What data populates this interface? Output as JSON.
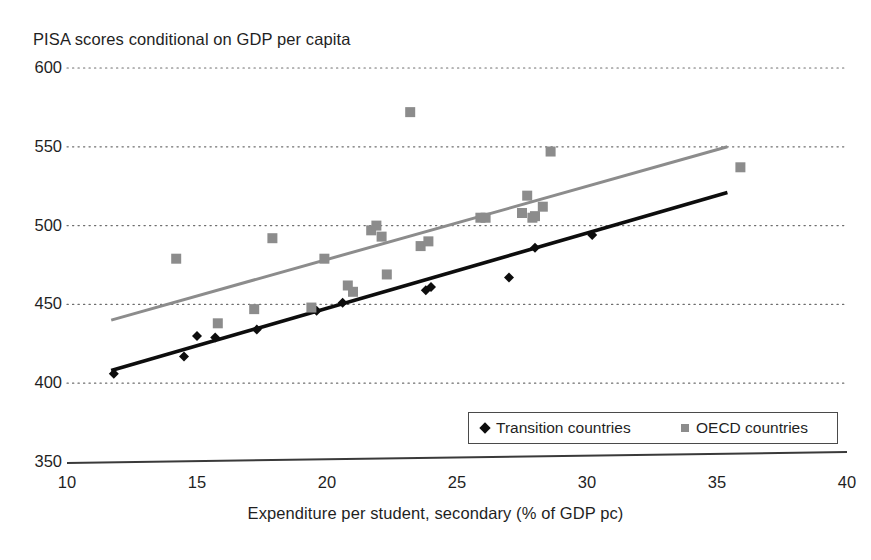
{
  "chart_data": {
    "type": "scatter",
    "title": "PISA scores conditional on GDP per capita",
    "xlabel": "Expenditure per student, secondary (% of GDP pc)",
    "ylabel": "",
    "xlim": [
      10,
      40
    ],
    "ylim": [
      350,
      600
    ],
    "xticks": [
      10,
      15,
      20,
      25,
      30,
      35,
      40
    ],
    "yticks": [
      350,
      400,
      450,
      500,
      550,
      600
    ],
    "grid": "horizontal-dotted",
    "legend_position": "bottom-center",
    "series": [
      {
        "name": "Transition countries",
        "marker": "diamond",
        "color": "#0d0d0d",
        "points": [
          [
            11.8,
            406
          ],
          [
            14.5,
            417
          ],
          [
            15.0,
            430
          ],
          [
            15.7,
            429
          ],
          [
            17.3,
            434
          ],
          [
            19.6,
            446
          ],
          [
            20.6,
            451
          ],
          [
            23.8,
            459
          ],
          [
            24.0,
            461
          ],
          [
            27.0,
            467
          ],
          [
            28.0,
            486
          ],
          [
            30.2,
            494
          ]
        ]
      },
      {
        "name": "OECD countries",
        "marker": "square",
        "color": "#8c8c8c",
        "points": [
          [
            14.2,
            479
          ],
          [
            15.8,
            438
          ],
          [
            17.2,
            447
          ],
          [
            17.9,
            492
          ],
          [
            19.4,
            448
          ],
          [
            19.9,
            479
          ],
          [
            20.8,
            462
          ],
          [
            21.0,
            458
          ],
          [
            21.7,
            497
          ],
          [
            21.9,
            500
          ],
          [
            22.1,
            493
          ],
          [
            22.3,
            469
          ],
          [
            23.2,
            572
          ],
          [
            23.6,
            487
          ],
          [
            23.9,
            490
          ],
          [
            25.9,
            505
          ],
          [
            26.1,
            505
          ],
          [
            27.5,
            508
          ],
          [
            27.7,
            519
          ],
          [
            27.9,
            505
          ],
          [
            28.0,
            506
          ],
          [
            28.3,
            512
          ],
          [
            28.6,
            547
          ],
          [
            35.9,
            537
          ]
        ]
      }
    ],
    "trendlines": [
      {
        "name": "Transition countries trend",
        "color": "#0d0d0d",
        "x0": 11.7,
        "y0": 408,
        "x1": 35.4,
        "y1": 521
      },
      {
        "name": "OECD countries trend",
        "color": "#8c8c8c",
        "x0": 11.7,
        "y0": 440,
        "x1": 35.4,
        "y1": 550
      }
    ],
    "legend": [
      {
        "label": "Transition countries",
        "marker": "diamond",
        "color": "#0d0d0d"
      },
      {
        "label": "OECD countries",
        "marker": "square",
        "color": "#8c8c8c"
      }
    ]
  }
}
